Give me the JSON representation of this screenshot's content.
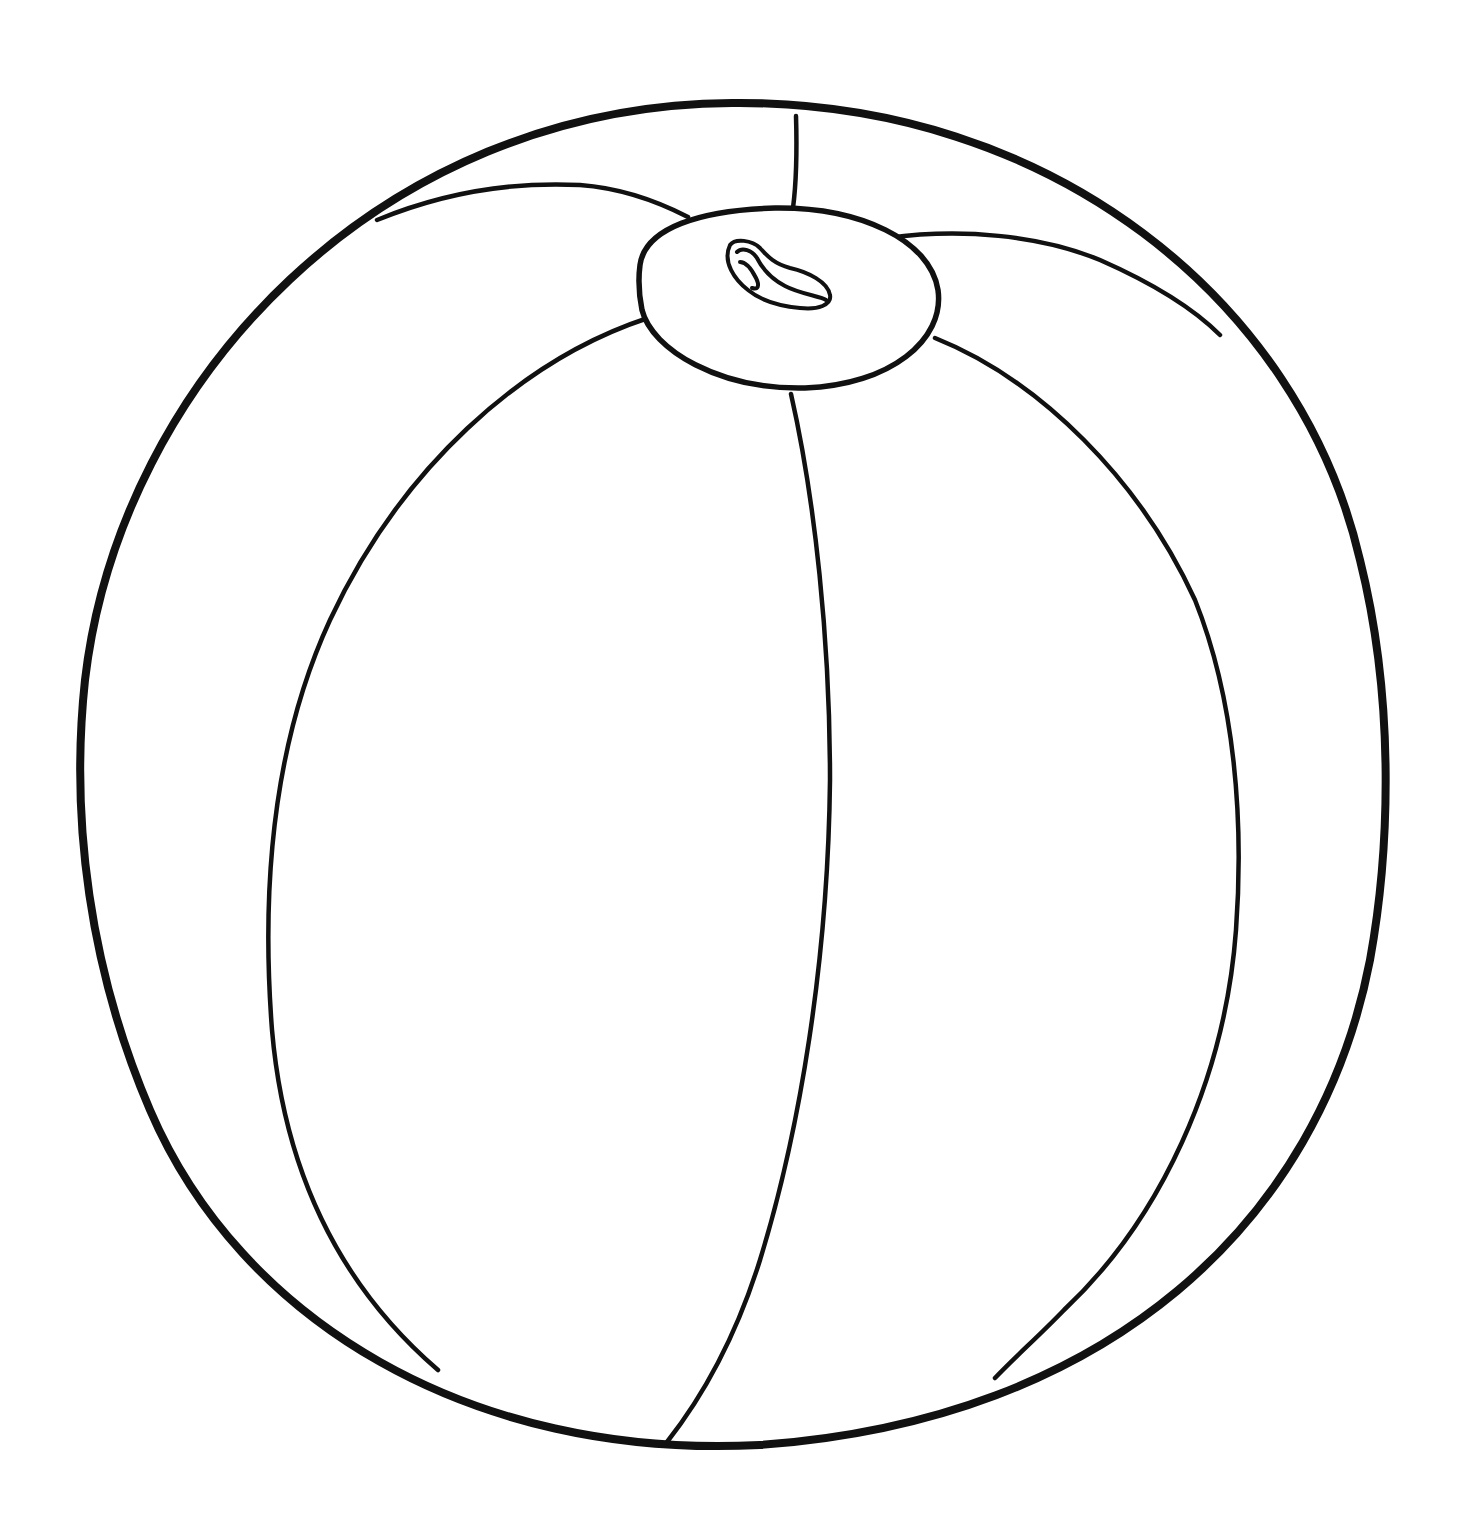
{
  "image": {
    "subject": "beach ball",
    "style": "black line art coloring page",
    "colors": {
      "background": "#ffffff",
      "line": "#111111"
    },
    "elements": [
      "outer-circle",
      "top-cap",
      "valve",
      "panel-seams"
    ]
  }
}
